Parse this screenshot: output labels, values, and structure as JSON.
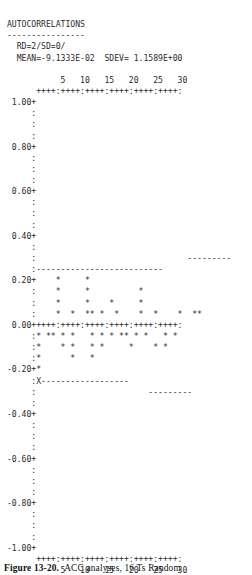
{
  "report": {
    "title": "AUTOCORRELATIONS",
    "rule": "----------------",
    "params_line": "  RD=2/SD=0/",
    "stats_line": "  MEAN=-9.1333E-02  SDEV= 1.1589E+00"
  },
  "axis": {
    "top_tick_labels": "           5   10   15   20   25   30",
    "top_tick_marks": "      ++++:++++:++++:++++:++++:++++:",
    "bottom_tick_marks": "      ++++:++++:++++:++++:++++:++++:",
    "bottom_tick_labels": "           5   10   15   20   25   30",
    "y_labels": [
      "1.00",
      "0.80",
      "0.60",
      "0.40",
      "0.20",
      "0.00",
      "-0.20",
      "-0.40",
      "-0.60",
      "-0.80",
      "-1.00"
    ],
    "x_tick_values": [
      5,
      10,
      15,
      20,
      25,
      30
    ],
    "y_max": 1.0,
    "y_min": -1.0
  },
  "plot_rows": [
    " 1.00+",
    "     :",
    "     :",
    "     :",
    " 0.80+",
    "     :",
    "     :",
    "     :",
    " 0.60+",
    "     :",
    "     :",
    "     :",
    " 0.40+",
    "     :",
    "     :                               ---------",
    "     :--------------------------",
    " 0.20+    *     *",
    "     :    *     *          *",
    "     :    *     *    *     *",
    "     :    *  *  ** *  *    *  *    *  **",
    " 0.00+++++:++++:++++:++++:++++:++++:",
    "     :* ** * *   * * * ** * *   * *",
    "     :*    * *   * *     *    * *",
    "     :*      *   *",
    "-0.20+*",
    "     :X------------------",
    "     :                       ---------",
    "     :",
    "-0.40+",
    "     :",
    "     :",
    "     :",
    "-0.60+",
    "     :",
    "     :",
    "     :",
    "-0.80+",
    "     :",
    "     :",
    "     :",
    "-1.00+"
  ],
  "chart_data": {
    "type": "bar",
    "title": "AUTOCORRELATIONS",
    "subtitle": "RD=2/SD=0/   MEAN=-9.1333E-02  SDEV= 1.1589E+00",
    "xlabel": "LAG",
    "ylabel": "AUTOCORRELATION",
    "xlim": [
      0,
      30
    ],
    "ylim": [
      -1.0,
      1.0
    ],
    "grid": false,
    "legend": null,
    "mean": -0.091333,
    "sdev": 1.1589,
    "x": [
      1,
      2,
      3,
      4,
      5,
      6,
      7,
      8,
      9,
      10,
      11,
      12,
      13,
      14,
      15,
      16,
      17,
      18,
      19,
      20,
      21,
      22,
      23,
      24,
      25,
      26,
      27,
      28,
      29,
      30
    ],
    "values": [
      -0.22,
      -0.14,
      -0.09,
      0.05,
      -0.1,
      0.22,
      0.05,
      -0.12,
      -0.06,
      0.05,
      0.22,
      -0.09,
      -0.05,
      0.05,
      -0.05,
      0.05,
      0.1,
      -0.05,
      -0.05,
      0.05,
      -0.1,
      0.16,
      -0.05,
      0.05,
      0.05,
      -0.1,
      -0.05,
      0.05,
      0.05,
      0.05
    ],
    "confidence_band": {
      "upper_left": 0.24,
      "upper_right": 0.3,
      "lower_left": -0.24,
      "lower_right": -0.3
    }
  },
  "caption": {
    "figure_number": "Figure 13-20.",
    "text": "ACC analyses, 16 Ts Random"
  }
}
